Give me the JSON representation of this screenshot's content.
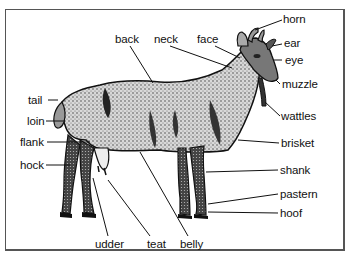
{
  "diagram": {
    "labels": {
      "back": "back",
      "neck": "neck",
      "face": "face",
      "horn": "horn",
      "ear": "ear",
      "eye": "eye",
      "muzzle": "muzzle",
      "wattles": "wattles",
      "tail": "tail",
      "loin": "loin",
      "flank": "flank",
      "hock": "hock",
      "brisket": "brisket",
      "shank": "shank",
      "pastern": "pastern",
      "hoof": "hoof",
      "udder": "udder",
      "teat": "teat",
      "belly": "belly"
    }
  }
}
